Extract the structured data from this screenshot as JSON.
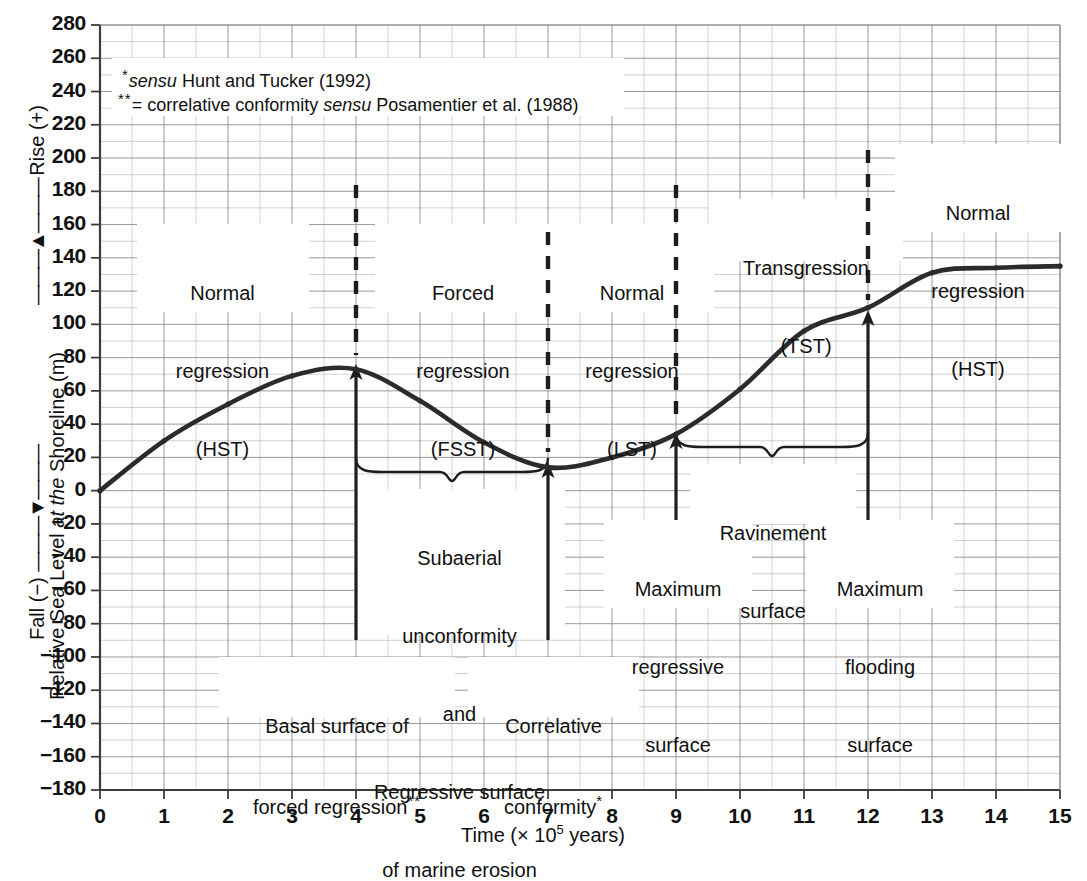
{
  "chart_data": {
    "type": "line",
    "title": "",
    "xlabel": "Time (× 10⁵ years)",
    "ylabel": "Relative Sea Level at the Shoreline (m)",
    "ylabel_parts": {
      "rise": "Rise (+)",
      "fall": "Fall (−)",
      "main_plain_1": "Relative Sea Level ",
      "main_italic": "at the",
      "main_plain_2": " Shoreline (m)"
    },
    "xlim": [
      0,
      15
    ],
    "ylim": [
      -180,
      280
    ],
    "x_ticks": [
      "0",
      "1",
      "2",
      "3",
      "4",
      "5",
      "6",
      "7",
      "8",
      "9",
      "10",
      "11",
      "12",
      "13",
      "14",
      "15"
    ],
    "y_ticks": [
      "280",
      "260",
      "240",
      "220",
      "200",
      "180",
      "160",
      "140",
      "120",
      "100",
      "80",
      "60",
      "40",
      "20",
      "0",
      "−20",
      "−40",
      "−60",
      "−80",
      "−100",
      "−120",
      "−140",
      "−160",
      "−180"
    ],
    "grid": true,
    "minor_grid": true,
    "legend": "none",
    "x": [
      0,
      1,
      2,
      3,
      4,
      5,
      6,
      7,
      8,
      9,
      10,
      11,
      12,
      13,
      14,
      15
    ],
    "values": [
      0,
      30,
      52,
      69,
      73,
      54,
      29,
      14,
      20,
      34,
      61,
      96,
      110,
      131,
      134,
      135
    ],
    "series": [
      {
        "name": "Relative sea level at the shoreline",
        "values": [
          0,
          30,
          52,
          69,
          73,
          54,
          29,
          14,
          20,
          34,
          61,
          96,
          110,
          131,
          134,
          135
        ]
      }
    ],
    "markers_at_x": [
      0,
      1,
      2,
      3,
      4,
      5,
      6,
      7,
      8,
      9,
      10,
      11,
      12,
      13,
      14,
      15
    ],
    "line_color": "#2b2b2b",
    "grid_color": "#9a9a9a",
    "axis_color": "#555555"
  },
  "notes": [
    {
      "marker": "*",
      "italic": "sensu",
      "text": " Hunt and Tucker (1992)"
    },
    {
      "marker": "**",
      "prefix": "= correlative conformity ",
      "italic": "sensu",
      "text": " Posamentier et al. (1988)"
    }
  ],
  "zone_labels": [
    {
      "line1": "Normal",
      "line2": "regression",
      "line3": "(HST)",
      "x_center": 3.0
    },
    {
      "line1": "Forced",
      "line2": "regression",
      "line3": "(FSST)",
      "x_center": 5.5
    },
    {
      "line1": "Normal",
      "line2": "regression",
      "line3": "(LST)",
      "x_center": 8.0
    },
    {
      "line1": "Transgression",
      "line2": "(TST)",
      "line3": "",
      "x_center": 10.5
    },
    {
      "line1": "Normal",
      "line2": "regression",
      "line3": "(HST)",
      "x_center": 13.4
    }
  ],
  "surface_labels": {
    "basal": {
      "line1": "Basal surface of",
      "line2": "forced regression",
      "marker": "**",
      "at_x": 4
    },
    "correlative": {
      "line1": "Correlative",
      "line2": "conformity",
      "marker": "*",
      "at_x": 7
    },
    "subaerial": {
      "line1": "Subaerial",
      "line2": "unconformity",
      "line3": "and",
      "line4": "Regressive surface",
      "line5": "of marine erosion",
      "span": [
        4,
        7
      ]
    },
    "max_regressive": {
      "line1": "Maximum",
      "line2": "regressive",
      "line3": "surface",
      "at_x": 9
    },
    "max_flooding": {
      "line1": "Maximum",
      "line2": "flooding",
      "line3": "surface",
      "at_x": 12
    },
    "ravinement": {
      "line1": "Ravinement",
      "line2": "surface",
      "span": [
        9,
        12
      ]
    }
  },
  "markers": {
    "dashed_verticals_x": [
      4,
      7,
      9,
      12
    ],
    "solid_arrow_verticals_x": [
      4,
      7,
      9,
      12
    ]
  }
}
